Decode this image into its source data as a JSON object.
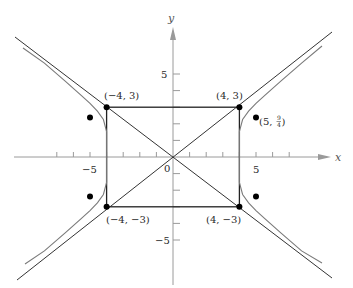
{
  "diagram": {
    "type": "hyperbola-with-asymptotes",
    "equation": "x^2/16 - y^2/9 = 1",
    "axes": {
      "x_label": "x",
      "y_label": "y",
      "x_tick_labels": {
        "neg5": "−5",
        "pos5": "5"
      },
      "y_tick_labels": {
        "pos5": "5",
        "neg5": "−5"
      },
      "origin_label": "0"
    },
    "rectangle_corners": {
      "top_left": "(−4, 3)",
      "top_right": "(4, 3)",
      "bottom_left": "(−4, −3)",
      "bottom_right": "(4, −3)"
    },
    "labeled_point": {
      "prefix": "(5, ",
      "frac_num": "9",
      "frac_den": "4",
      "suffix": ")"
    },
    "colors": {
      "asymptote": "#333333",
      "curve": "#7a7a7a",
      "axis": "#9a9a9a",
      "rect": "#222222",
      "point": "#000000"
    }
  }
}
